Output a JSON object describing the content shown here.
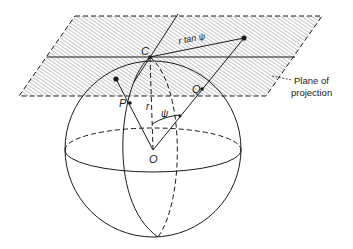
{
  "figure": {
    "labels": {
      "point_c": "C",
      "point_p": "P",
      "point_q": "Q",
      "point_o": "O",
      "radius": "r",
      "angle": "ψ",
      "tangent_distance": "r tan ψ",
      "plane_line1": "Plane of",
      "plane_line2": "projection"
    },
    "colors": {
      "ink": "#1a1a1a",
      "hatch": "#8a8a8a",
      "background": "#ffffff"
    }
  }
}
